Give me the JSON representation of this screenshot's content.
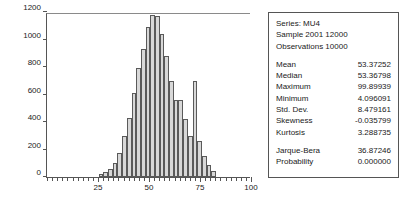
{
  "chart_data": {
    "type": "bar",
    "title": "",
    "xlabel": "",
    "ylabel": "",
    "xlim": [
      0,
      100
    ],
    "ylim": [
      0,
      1200
    ],
    "grid": false,
    "legend": false,
    "ytick_labels": [
      "0",
      "200",
      "400",
      "600",
      "800",
      "1000",
      "1200"
    ],
    "ytick_values": [
      0,
      200,
      400,
      600,
      800,
      1000,
      1200
    ],
    "xtick_labels": [
      "25",
      "50",
      "75",
      "100"
    ],
    "xtick_values": [
      25,
      50,
      75,
      100
    ],
    "bin_width": 2.3,
    "categories": [
      26.5,
      28.8,
      31.1,
      33.4,
      35.7,
      38.0,
      40.3,
      42.6,
      44.9,
      47.2,
      49.5,
      51.8,
      54.1,
      56.4,
      58.7,
      61.0,
      63.3,
      65.6,
      67.9,
      70.2,
      72.5,
      74.8,
      77.1,
      79.4,
      81.7
    ],
    "values": [
      20,
      35,
      60,
      105,
      175,
      300,
      430,
      610,
      790,
      930,
      1090,
      1180,
      1170,
      1040,
      880,
      700,
      560,
      560,
      420,
      300,
      700,
      260,
      150,
      90,
      45
    ]
  },
  "stats": {
    "header": [
      "Series: MU4",
      "Sample 2001 12000",
      "Observations 10000"
    ],
    "rows": [
      {
        "label": "Mean",
        "value": "53.37252"
      },
      {
        "label": "Median",
        "value": "53.36798"
      },
      {
        "label": "Maximum",
        "value": "99.89939"
      },
      {
        "label": "Minimum",
        "value": "4.096091"
      },
      {
        "label": "Std. Dev.",
        "value": "8.479161"
      },
      {
        "label": "Skewness",
        "value": "-0.035799"
      },
      {
        "label": "Kurtosis",
        "value": "3.288735"
      }
    ],
    "tests": [
      {
        "label": "Jarque-Bera",
        "value": "36.87246"
      },
      {
        "label": "Probability",
        "value": "0.000000"
      }
    ]
  },
  "colors": {
    "bar_fill": "#d8d8d8",
    "bar_stroke": "#5a5a5a",
    "axis": "#555555",
    "text": "#1a1a1a",
    "panel_border": "#555555",
    "background": "#ffffff"
  }
}
